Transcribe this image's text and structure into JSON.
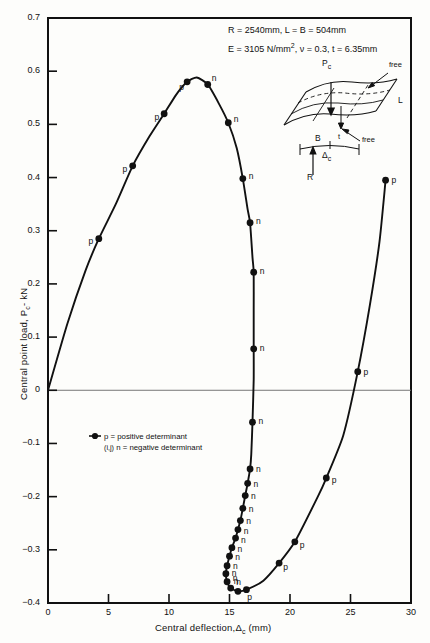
{
  "figure": {
    "annotation": {
      "line1": "R = 2540mm, L = B = 504mm",
      "line2_a": "E = 3105 N/mm",
      "line2_sup": "2",
      "line2_b": ", ν = 0.3, t = 6.35mm"
    },
    "inset": {
      "load_label": "P",
      "load_sub": "c",
      "free_top": "free",
      "free_bottom": "free",
      "length_label": "L",
      "breadth_label": "B",
      "thickness_label": "t",
      "deflection_label": "Δ",
      "deflection_sub": "c",
      "radius_label": "R"
    },
    "legend": {
      "marker_label": "(i,j)",
      "positive": "p = positive determinant",
      "negative": "n = negative determinant"
    }
  },
  "chart_data": {
    "type": "line",
    "title": "",
    "xlabel_a": "Central deflection,",
    "xlabel_delta": "Δ",
    "xlabel_sub": "c",
    "xlabel_units": "(mm)",
    "ylabel_a": "Central point load, P",
    "ylabel_sub": "c",
    "ylabel_units": "- kN",
    "xlim": [
      0,
      30
    ],
    "ylim": [
      -0.4,
      0.7
    ],
    "xticks": [
      0,
      5,
      10,
      15,
      20,
      25,
      30
    ],
    "yticks": [
      -0.4,
      -0.3,
      -0.2,
      -0.1,
      0,
      0.1,
      0.2,
      0.3,
      0.4,
      0.5,
      0.6,
      0.7
    ],
    "ytick_labels": [
      "-0.4",
      "-0.3",
      "-0.2",
      "-0.1",
      "0",
      "0.1",
      "0.2",
      "0.3",
      "0.4",
      "0.5",
      "0.6",
      "0.7"
    ],
    "grid": false,
    "zero_line": true,
    "legend_position": "inside-left",
    "series": [
      {
        "name": "equilibrium path",
        "comment": "x = central deflection (mm), y = central point load (kN), det = determinant sign marker",
        "path": [
          {
            "x": 0.0,
            "y": 0.0
          },
          {
            "x": 1.6,
            "y": 0.125
          },
          {
            "x": 3.1,
            "y": 0.225
          },
          {
            "x": 4.2,
            "y": 0.285,
            "det": "p"
          },
          {
            "x": 5.6,
            "y": 0.35
          },
          {
            "x": 7.0,
            "y": 0.422,
            "det": "p"
          },
          {
            "x": 8.4,
            "y": 0.478
          },
          {
            "x": 9.6,
            "y": 0.52,
            "det": "p"
          },
          {
            "x": 10.6,
            "y": 0.556
          },
          {
            "x": 11.5,
            "y": 0.58,
            "det": "p"
          },
          {
            "x": 12.3,
            "y": 0.588
          },
          {
            "x": 13.2,
            "y": 0.575,
            "det": "n"
          },
          {
            "x": 14.1,
            "y": 0.54
          },
          {
            "x": 14.9,
            "y": 0.503,
            "det": "n"
          },
          {
            "x": 15.6,
            "y": 0.455
          },
          {
            "x": 16.1,
            "y": 0.398,
            "det": "n"
          },
          {
            "x": 16.5,
            "y": 0.34
          },
          {
            "x": 16.7,
            "y": 0.315,
            "det": "n"
          },
          {
            "x": 16.9,
            "y": 0.25
          },
          {
            "x": 17.0,
            "y": 0.222,
            "det": "n"
          },
          {
            "x": 17.0,
            "y": 0.15
          },
          {
            "x": 17.0,
            "y": 0.078,
            "det": "n"
          },
          {
            "x": 17.0,
            "y": 0.02
          },
          {
            "x": 16.9,
            "y": -0.06,
            "det": "n"
          },
          {
            "x": 16.8,
            "y": -0.12
          },
          {
            "x": 16.7,
            "y": -0.148,
            "det": "n"
          },
          {
            "x": 16.5,
            "y": -0.175,
            "det": "n"
          },
          {
            "x": 16.3,
            "y": -0.198,
            "det": "n"
          },
          {
            "x": 16.1,
            "y": -0.222,
            "det": "n"
          },
          {
            "x": 15.9,
            "y": -0.245,
            "det": "n"
          },
          {
            "x": 15.7,
            "y": -0.262,
            "det": "n"
          },
          {
            "x": 15.5,
            "y": -0.278,
            "det": "n"
          },
          {
            "x": 15.2,
            "y": -0.296,
            "det": "n"
          },
          {
            "x": 15.0,
            "y": -0.312,
            "det": "n"
          },
          {
            "x": 14.8,
            "y": -0.33,
            "det": "n"
          },
          {
            "x": 14.7,
            "y": -0.345,
            "det": "n"
          },
          {
            "x": 14.8,
            "y": -0.36,
            "det": "n"
          },
          {
            "x": 15.1,
            "y": -0.372,
            "det": "n"
          },
          {
            "x": 15.7,
            "y": -0.378,
            "det": "n"
          },
          {
            "x": 16.4,
            "y": -0.375,
            "det": "p"
          },
          {
            "x": 17.8,
            "y": -0.358
          },
          {
            "x": 19.1,
            "y": -0.325,
            "det": "p"
          },
          {
            "x": 20.4,
            "y": -0.285,
            "det": "p"
          },
          {
            "x": 22.3,
            "y": -0.2
          },
          {
            "x": 23.0,
            "y": -0.165,
            "det": "p"
          },
          {
            "x": 24.4,
            "y": -0.085
          },
          {
            "x": 25.6,
            "y": 0.035,
            "det": "p"
          },
          {
            "x": 26.6,
            "y": 0.16
          },
          {
            "x": 27.4,
            "y": 0.28
          },
          {
            "x": 27.9,
            "y": 0.395,
            "det": "p"
          }
        ]
      }
    ]
  }
}
